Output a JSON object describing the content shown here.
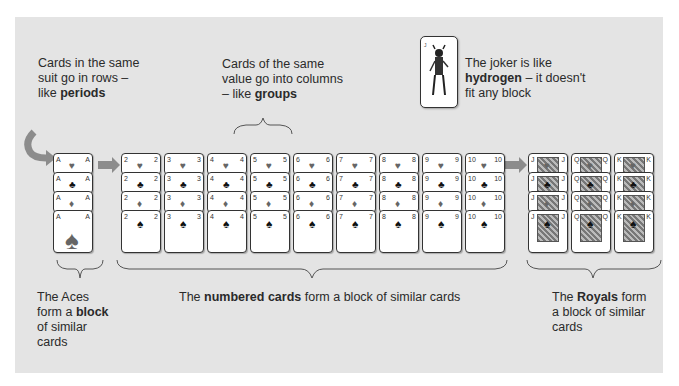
{
  "colors": {
    "panel_bg": "#e4e4e4",
    "arrow": "#8c8c8c",
    "card_border": "#333333",
    "text": "#2a2a2a"
  },
  "captions": {
    "rows": {
      "text": "Cards in the same suit go in rows – like ",
      "bold": "periods"
    },
    "columns": {
      "text": "Cards of the same value go into columns – like ",
      "bold": "groups"
    },
    "joker": {
      "bold": "hydrogen",
      "before": "The joker is like ",
      "after": " – it doesn't fit any block"
    },
    "aces": {
      "before": "The Aces form a ",
      "bold": "block",
      "after": " of similar cards"
    },
    "numbered": {
      "before": "The ",
      "bold": "numbered cards",
      "after": " form a block of similar cards"
    },
    "royals": {
      "before": "The ",
      "bold": "Royals",
      "after": " form a block of similar cards"
    }
  },
  "suits_rows": [
    "hearts",
    "clubs",
    "diamonds",
    "spades"
  ],
  "suit_glyphs": {
    "hearts": "♥",
    "clubs": "♣",
    "diamonds": "♦",
    "spades": "♠"
  },
  "columns": {
    "aces": [
      "A"
    ],
    "numbered": [
      "2",
      "3",
      "4",
      "5",
      "6",
      "7",
      "8",
      "9",
      "10"
    ],
    "royals": [
      "J",
      "Q",
      "K"
    ]
  },
  "joker_card": {
    "label": "Joker"
  }
}
